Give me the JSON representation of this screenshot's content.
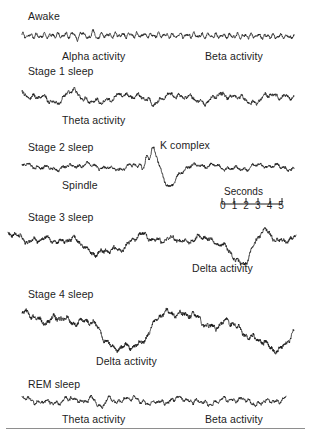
{
  "figure": {
    "background_color": "#ffffff",
    "trace_color": "#111111",
    "text_color": "#1d1d1d",
    "rule_color": "#8e8e8e"
  },
  "scale": {
    "caption": "Seconds",
    "ticks": [
      "0",
      "1",
      "2",
      "3",
      "4",
      "5"
    ],
    "unit": "seconds",
    "x_start": 222,
    "x_end": 282,
    "caption_x": 224,
    "caption_y": 186,
    "bar_y": 198,
    "numbers_y": 200
  },
  "bottom_rule": {
    "x": 6,
    "y": 428,
    "width": 299,
    "height": 1.4
  },
  "stages": [
    {
      "id": "awake",
      "label": "Awake",
      "label_x": 28,
      "label_y": 10,
      "trace": {
        "x": 22,
        "y": 28,
        "width": 272,
        "height": 16,
        "baseline": 8,
        "seed": 1101,
        "components": [
          {
            "freq": 0.6,
            "amp": 0.6,
            "phase": 0.2
          },
          {
            "freq": 38,
            "amp": 1.5,
            "phase": 1.1
          },
          {
            "freq": 62,
            "amp": 1.1,
            "phase": 0.4
          }
        ],
        "noise": 1.0,
        "burst": {
          "start": 0.17,
          "end": 0.3,
          "freq": 28,
          "amp": 4.2
        },
        "samples": 1100
      },
      "annotations": [
        {
          "text": "Alpha activity",
          "x": 62,
          "y": 50,
          "name": "alpha-activity-label"
        },
        {
          "text": "Beta activity",
          "x": 205,
          "y": 50,
          "name": "beta-activity-label"
        }
      ]
    },
    {
      "id": "stage-1",
      "label": "Stage 1 sleep",
      "label_x": 28,
      "label_y": 65,
      "trace": {
        "x": 22,
        "y": 84,
        "width": 272,
        "height": 26,
        "baseline": 14,
        "seed": 2202,
        "components": [
          {
            "freq": 5.5,
            "amp": 3.4,
            "phase": 0.7
          },
          {
            "freq": 11,
            "amp": 2.0,
            "phase": 2.3
          },
          {
            "freq": 26,
            "amp": 1.6,
            "phase": 0.9
          },
          {
            "freq": 47,
            "amp": 1.0,
            "phase": 1.7
          }
        ],
        "noise": 1.3,
        "burst": {
          "start": 0.12,
          "end": 0.34,
          "freq": 7,
          "amp": 5.0
        },
        "samples": 1100
      },
      "annotations": [
        {
          "text": "Theta activity",
          "x": 62,
          "y": 114,
          "name": "theta-activity-label"
        }
      ]
    },
    {
      "id": "stage-2",
      "label": "Stage 2 sleep",
      "label_x": 28,
      "label_y": 141,
      "trace": {
        "x": 22,
        "y": 150,
        "width": 272,
        "height": 38,
        "baseline": 17,
        "seed": 3303,
        "components": [
          {
            "freq": 4.5,
            "amp": 1.9,
            "phase": 1.4
          },
          {
            "freq": 13,
            "amp": 1.5,
            "phase": 0.3
          },
          {
            "freq": 33,
            "amp": 1.2,
            "phase": 2.1
          }
        ],
        "noise": 1.1,
        "spindle": {
          "start": 0.4,
          "end": 0.5,
          "freq": 42,
          "amp": 4.5
        },
        "kcomplex": {
          "center": 0.525,
          "width": 0.075,
          "up": 15,
          "down": 19
        },
        "samples": 1200
      },
      "annotations": [
        {
          "text": "K complex",
          "x": 160,
          "y": 139,
          "name": "k-complex-label"
        },
        {
          "text": "Spindle",
          "x": 62,
          "y": 179,
          "name": "spindle-label"
        }
      ]
    },
    {
      "id": "stage-3",
      "label": "Stage 3 sleep",
      "label_x": 28,
      "label_y": 211,
      "trace": {
        "x": 8,
        "y": 223,
        "width": 288,
        "height": 42,
        "baseline": 20,
        "seed": 4404,
        "components": [
          {
            "freq": 2.1,
            "amp": 6.5,
            "phase": 0.5
          },
          {
            "freq": 4.3,
            "amp": 4.0,
            "phase": 1.9
          },
          {
            "freq": 9,
            "amp": 2.6,
            "phase": 0.8
          },
          {
            "freq": 21,
            "amp": 1.8,
            "phase": 2.6
          },
          {
            "freq": 44,
            "amp": 1.1,
            "phase": 1.2
          }
        ],
        "noise": 1.4,
        "delta_burst": {
          "start": 0.7,
          "end": 1.0,
          "freq": 2.2,
          "amp": 13
        },
        "samples": 1300
      },
      "annotations": [
        {
          "text": "Delta activity",
          "x": 192,
          "y": 262,
          "name": "delta-activity-label-stage3"
        }
      ]
    },
    {
      "id": "stage-4",
      "label": "Stage 4 sleep",
      "label_x": 28,
      "label_y": 288,
      "trace": {
        "x": 22,
        "y": 298,
        "width": 272,
        "height": 56,
        "baseline": 30,
        "seed": 5505,
        "components": [
          {
            "freq": 1.9,
            "amp": 15,
            "phase": 0.4
          },
          {
            "freq": 3.6,
            "amp": 7.5,
            "phase": 2.2
          },
          {
            "freq": 8,
            "amp": 3.2,
            "phase": 1.1
          },
          {
            "freq": 19,
            "amp": 2.0,
            "phase": 0.6
          },
          {
            "freq": 41,
            "amp": 1.2,
            "phase": 2.9
          }
        ],
        "noise": 1.5,
        "samples": 1300
      },
      "annotations": [
        {
          "text": "Delta activity",
          "x": 96,
          "y": 355,
          "name": "delta-activity-label-stage4"
        }
      ]
    },
    {
      "id": "rem",
      "label": "REM sleep",
      "label_x": 28,
      "label_y": 378,
      "trace": {
        "x": 22,
        "y": 392,
        "width": 264,
        "height": 18,
        "baseline": 9,
        "seed": 6606,
        "components": [
          {
            "freq": 5.0,
            "amp": 1.9,
            "phase": 1.6
          },
          {
            "freq": 12,
            "amp": 1.5,
            "phase": 0.9
          },
          {
            "freq": 30,
            "amp": 1.3,
            "phase": 2.4
          },
          {
            "freq": 55,
            "amp": 0.9,
            "phase": 0.2
          }
        ],
        "noise": 1.1,
        "burst": {
          "start": 0.2,
          "end": 0.42,
          "freq": 16,
          "amp": 3.4
        },
        "samples": 1100
      },
      "annotations": [
        {
          "text": "Theta activity",
          "x": 62,
          "y": 413,
          "name": "theta-activity-label-rem"
        },
        {
          "text": "Beta activity",
          "x": 205,
          "y": 413,
          "name": "beta-activity-label-rem"
        }
      ]
    }
  ]
}
